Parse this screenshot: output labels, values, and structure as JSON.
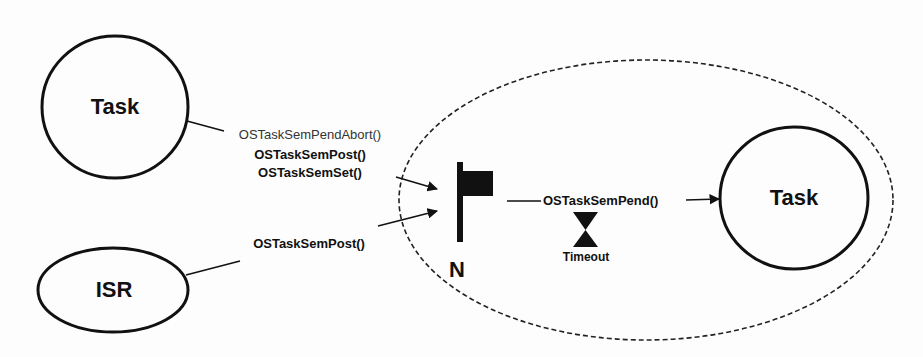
{
  "diagram": {
    "nodes": {
      "task_left": {
        "label": "Task"
      },
      "isr": {
        "label": "ISR"
      },
      "task_right": {
        "label": "Task"
      }
    },
    "semaphore": {
      "label": "N",
      "icon": "flag-icon"
    },
    "calls": {
      "task_to_sem": [
        "OSTaskSemPendAbort()",
        "OSTaskSemPost()",
        "OSTaskSemSet()"
      ],
      "isr_to_sem": "OSTaskSemPost()",
      "sem_to_task": "OSTaskSemPend()"
    },
    "timeout": {
      "label": "Timeout",
      "icon": "hourglass-icon"
    },
    "colors": {
      "stroke": "#111111",
      "background": "#fdfdfd"
    }
  }
}
